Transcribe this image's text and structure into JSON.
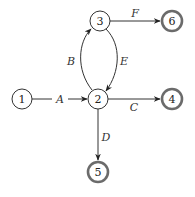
{
  "diagram": {
    "type": "state-graph",
    "nodes": [
      {
        "id": "1",
        "label": "1",
        "x": 22,
        "y": 99,
        "accepting": false
      },
      {
        "id": "2",
        "label": "2",
        "x": 98,
        "y": 99,
        "accepting": false
      },
      {
        "id": "3",
        "label": "3",
        "x": 100,
        "y": 21,
        "accepting": false
      },
      {
        "id": "4",
        "label": "4",
        "x": 172,
        "y": 99,
        "accepting": true
      },
      {
        "id": "5",
        "label": "5",
        "x": 98,
        "y": 172,
        "accepting": true
      },
      {
        "id": "6",
        "label": "6",
        "x": 172,
        "y": 21,
        "accepting": true
      }
    ],
    "edges": [
      {
        "id": "A",
        "label": "A",
        "from": "1",
        "to": "2",
        "label_x": 60,
        "label_y": 99
      },
      {
        "id": "B",
        "label": "B",
        "from": "2",
        "to": "3",
        "label_x": 71,
        "label_y": 61
      },
      {
        "id": "E",
        "label": "E",
        "from": "3",
        "to": "2",
        "label_x": 124,
        "label_y": 61
      },
      {
        "id": "F",
        "label": "F",
        "from": "3",
        "to": "6",
        "label_x": 135,
        "label_y": 14
      },
      {
        "id": "C",
        "label": "C",
        "from": "2",
        "to": "4",
        "label_x": 134,
        "label_y": 106
      },
      {
        "id": "D",
        "label": "D",
        "from": "2",
        "to": "5",
        "label_x": 106,
        "label_y": 138
      }
    ]
  }
}
